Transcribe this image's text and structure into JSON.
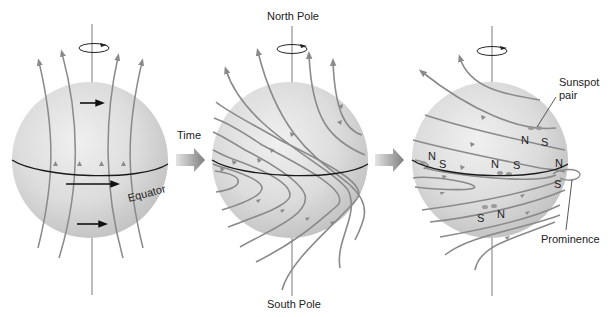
{
  "colors": {
    "background": "#ffffff",
    "sphere_light": "#eeeeee",
    "sphere_dark": "#c4c4c4",
    "field_line": "#8a8a8a",
    "equator": "#1a1a1a",
    "time_arrow": "#8c8c8c",
    "text": "#222222"
  },
  "labels": {
    "time": "Time",
    "north_pole": "North Pole",
    "south_pole": "South Pole",
    "equator": "Equator",
    "sunspot_pair": [
      "Sunspot",
      "pair"
    ],
    "prominence": "Prominence"
  },
  "panels": [
    {
      "id": "panel-1",
      "description": "Initial field lines run pole to pole; rotation arrows show faster equatorial rotation"
    },
    {
      "id": "panel-2",
      "description": "Field lines wound up by differential rotation"
    },
    {
      "id": "panel-3",
      "description": "Twisted field lines break through surface forming sunspot pairs and a prominence"
    }
  ],
  "sunspot_markers": [
    {
      "pole": "N",
      "panel": 3,
      "group": "upper-right"
    },
    {
      "pole": "S",
      "panel": 3,
      "group": "upper-right"
    },
    {
      "pole": "N",
      "panel": 3,
      "group": "left"
    },
    {
      "pole": "S",
      "panel": 3,
      "group": "left"
    },
    {
      "pole": "N",
      "panel": 3,
      "group": "center"
    },
    {
      "pole": "S",
      "panel": 3,
      "group": "center"
    },
    {
      "pole": "N",
      "panel": 3,
      "group": "right-edge"
    },
    {
      "pole": "S",
      "panel": 3,
      "group": "right-edge"
    },
    {
      "pole": "S",
      "panel": 3,
      "group": "lower"
    },
    {
      "pole": "N",
      "panel": 3,
      "group": "lower"
    }
  ]
}
